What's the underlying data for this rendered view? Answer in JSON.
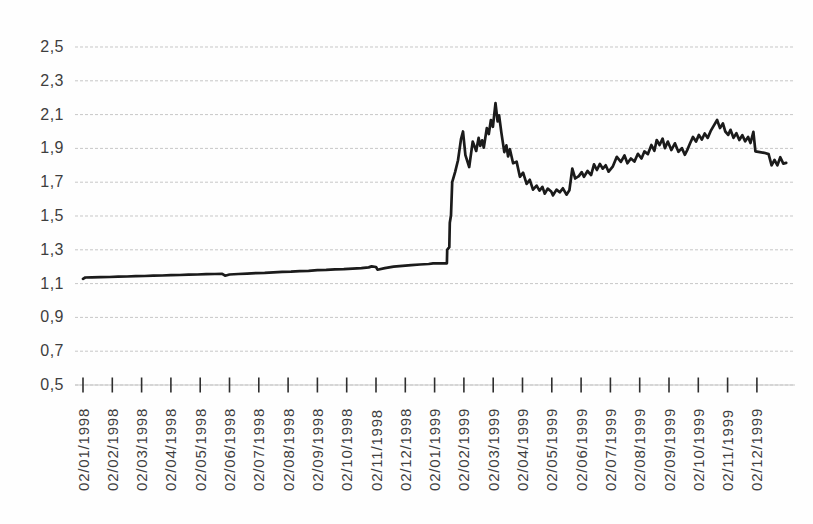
{
  "figure": {
    "title": ""
  },
  "chart_data": {
    "type": "line",
    "title": "",
    "xlabel": "",
    "ylabel": "",
    "legend": "none",
    "grid": "horizontal light dashed lines",
    "line_color": "#1b1b1b",
    "grid_color": "#c7c7c7",
    "tick_color": "#2e2e2e",
    "label_color": "#3e3e3e",
    "ylim": [
      0.5,
      2.5
    ],
    "y_ticks": [
      2.5,
      2.3,
      2.1,
      1.9,
      1.7,
      1.5,
      1.3,
      1.1,
      0.9,
      0.7,
      0.5
    ],
    "y_tick_labels": [
      "2,5",
      "2,3",
      "2,1",
      "1,9",
      "1,7",
      "1,5",
      "1,3",
      "1,1",
      "0,9",
      "0,7",
      "0,5"
    ],
    "x_tick_labels": [
      "02/01/1998",
      "02/02/1998",
      "02/03/1998",
      "02/04/1998",
      "02/05/1998",
      "02/06/1998",
      "02/07/1998",
      "02/08/1998",
      "02/09/1998",
      "02/10/1998",
      "02/11/1998",
      "02/12/1998",
      "02/01/1999",
      "02/02/1999",
      "02/03/1999",
      "02/04/1999",
      "02/05/1999",
      "02/06/1999",
      "02/07/1999",
      "02/08/1999",
      "02/09/1999",
      "02/10/1999",
      "02/11/1999",
      "02/12/1999"
    ],
    "x_unit": "months (index aligned to x_tick_labels, daily series)",
    "series": [
      {
        "name": "exchange-rate",
        "points": [
          [
            0.0,
            1.128
          ],
          [
            0.08,
            1.136
          ],
          [
            0.3,
            1.137
          ],
          [
            0.6,
            1.138
          ],
          [
            0.9,
            1.139
          ],
          [
            1.2,
            1.141
          ],
          [
            1.5,
            1.142
          ],
          [
            1.8,
            1.144
          ],
          [
            2.1,
            1.145
          ],
          [
            2.4,
            1.147
          ],
          [
            2.7,
            1.148
          ],
          [
            3.0,
            1.15
          ],
          [
            3.3,
            1.151
          ],
          [
            3.6,
            1.153
          ],
          [
            3.9,
            1.154
          ],
          [
            4.2,
            1.156
          ],
          [
            4.5,
            1.157
          ],
          [
            4.75,
            1.158
          ],
          [
            4.85,
            1.147
          ],
          [
            5.0,
            1.154
          ],
          [
            5.3,
            1.157
          ],
          [
            5.6,
            1.159
          ],
          [
            5.9,
            1.162
          ],
          [
            6.2,
            1.164
          ],
          [
            6.5,
            1.167
          ],
          [
            6.8,
            1.169
          ],
          [
            7.1,
            1.171
          ],
          [
            7.4,
            1.174
          ],
          [
            7.7,
            1.176
          ],
          [
            8.0,
            1.179
          ],
          [
            8.3,
            1.181
          ],
          [
            8.6,
            1.184
          ],
          [
            8.9,
            1.186
          ],
          [
            9.2,
            1.189
          ],
          [
            9.5,
            1.192
          ],
          [
            9.75,
            1.196
          ],
          [
            9.85,
            1.202
          ],
          [
            10.0,
            1.198
          ],
          [
            10.05,
            1.182
          ],
          [
            10.3,
            1.192
          ],
          [
            10.6,
            1.2
          ],
          [
            10.9,
            1.205
          ],
          [
            11.2,
            1.209
          ],
          [
            11.5,
            1.213
          ],
          [
            11.8,
            1.216
          ],
          [
            11.95,
            1.22
          ],
          [
            12.42,
            1.22
          ],
          [
            12.43,
            1.3
          ],
          [
            12.5,
            1.316
          ],
          [
            12.52,
            1.46
          ],
          [
            12.56,
            1.505
          ],
          [
            12.6,
            1.7
          ],
          [
            12.7,
            1.76
          ],
          [
            12.8,
            1.83
          ],
          [
            12.9,
            1.955
          ],
          [
            12.97,
            2.0
          ],
          [
            13.05,
            1.86
          ],
          [
            13.18,
            1.79
          ],
          [
            13.3,
            1.94
          ],
          [
            13.42,
            1.885
          ],
          [
            13.5,
            1.962
          ],
          [
            13.56,
            1.915
          ],
          [
            13.62,
            1.948
          ],
          [
            13.68,
            1.905
          ],
          [
            13.78,
            2.02
          ],
          [
            13.85,
            1.985
          ],
          [
            13.92,
            2.068
          ],
          [
            13.99,
            2.028
          ],
          [
            14.08,
            2.168
          ],
          [
            14.15,
            2.06
          ],
          [
            14.2,
            2.096
          ],
          [
            14.28,
            1.992
          ],
          [
            14.38,
            1.878
          ],
          [
            14.45,
            1.918
          ],
          [
            14.51,
            1.852
          ],
          [
            14.57,
            1.895
          ],
          [
            14.68,
            1.812
          ],
          [
            14.8,
            1.822
          ],
          [
            14.91,
            1.732
          ],
          [
            15.02,
            1.756
          ],
          [
            15.14,
            1.69
          ],
          [
            15.25,
            1.714
          ],
          [
            15.36,
            1.656
          ],
          [
            15.48,
            1.68
          ],
          [
            15.58,
            1.65
          ],
          [
            15.68,
            1.672
          ],
          [
            15.76,
            1.632
          ],
          [
            15.86,
            1.662
          ],
          [
            15.98,
            1.645
          ],
          [
            16.04,
            1.622
          ],
          [
            16.16,
            1.656
          ],
          [
            16.27,
            1.64
          ],
          [
            16.38,
            1.664
          ],
          [
            16.5,
            1.626
          ],
          [
            16.6,
            1.652
          ],
          [
            16.7,
            1.78
          ],
          [
            16.8,
            1.722
          ],
          [
            16.92,
            1.736
          ],
          [
            17.02,
            1.76
          ],
          [
            17.1,
            1.732
          ],
          [
            17.22,
            1.766
          ],
          [
            17.34,
            1.742
          ],
          [
            17.44,
            1.806
          ],
          [
            17.54,
            1.772
          ],
          [
            17.64,
            1.808
          ],
          [
            17.74,
            1.78
          ],
          [
            17.84,
            1.8
          ],
          [
            17.94,
            1.762
          ],
          [
            18.08,
            1.792
          ],
          [
            18.22,
            1.85
          ],
          [
            18.36,
            1.82
          ],
          [
            18.48,
            1.858
          ],
          [
            18.58,
            1.812
          ],
          [
            18.7,
            1.84
          ],
          [
            18.82,
            1.822
          ],
          [
            18.94,
            1.868
          ],
          [
            19.06,
            1.84
          ],
          [
            19.16,
            1.882
          ],
          [
            19.28,
            1.866
          ],
          [
            19.4,
            1.92
          ],
          [
            19.5,
            1.886
          ],
          [
            19.58,
            1.95
          ],
          [
            19.68,
            1.92
          ],
          [
            19.78,
            1.958
          ],
          [
            19.86,
            1.902
          ],
          [
            19.96,
            1.94
          ],
          [
            20.08,
            1.89
          ],
          [
            20.2,
            1.93
          ],
          [
            20.32,
            1.88
          ],
          [
            20.44,
            1.902
          ],
          [
            20.54,
            1.862
          ],
          [
            20.62,
            1.89
          ],
          [
            20.72,
            1.93
          ],
          [
            20.82,
            1.968
          ],
          [
            20.92,
            1.94
          ],
          [
            21.02,
            1.98
          ],
          [
            21.12,
            1.952
          ],
          [
            21.22,
            1.988
          ],
          [
            21.32,
            1.962
          ],
          [
            21.42,
            2.002
          ],
          [
            21.52,
            2.032
          ],
          [
            21.64,
            2.068
          ],
          [
            21.74,
            2.02
          ],
          [
            21.84,
            2.048
          ],
          [
            21.92,
            2.0
          ],
          [
            22.02,
            1.98
          ],
          [
            22.1,
            2.01
          ],
          [
            22.2,
            1.962
          ],
          [
            22.3,
            1.99
          ],
          [
            22.4,
            1.95
          ],
          [
            22.5,
            1.978
          ],
          [
            22.6,
            1.942
          ],
          [
            22.7,
            1.968
          ],
          [
            22.78,
            1.932
          ],
          [
            22.88,
            1.998
          ],
          [
            22.95,
            1.882
          ],
          [
            23.1,
            1.878
          ],
          [
            23.25,
            1.874
          ],
          [
            23.4,
            1.866
          ],
          [
            23.5,
            1.8
          ],
          [
            23.6,
            1.832
          ],
          [
            23.7,
            1.8
          ],
          [
            23.8,
            1.848
          ],
          [
            23.9,
            1.81
          ],
          [
            24.0,
            1.814
          ]
        ]
      }
    ]
  }
}
